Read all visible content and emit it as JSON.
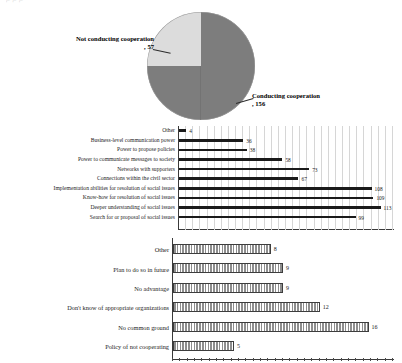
{
  "header": {
    "cut_off_text": "⌐ ⌐                         ⌐"
  },
  "pie": {
    "labels": {
      "not_conducting": "Not conducting\ncooperation, 57",
      "conducting": "Conducting\ncooperation, 156"
    }
  },
  "chart_data": [
    {
      "type": "pie",
      "title": "",
      "categories": [
        "Conducting cooperation",
        "Not conducting cooperation"
      ],
      "values": [
        156,
        57
      ],
      "labels": [
        "Conducting cooperation, 156",
        "Not conducting cooperation, 57"
      ],
      "colors": [
        "#7d7d7d",
        "#dcdcdc"
      ],
      "legend": "none",
      "grid": false
    },
    {
      "type": "bar",
      "orientation": "horizontal",
      "title": "",
      "xlabel": "",
      "ylabel": "",
      "grid": true,
      "xlim": [
        0,
        120
      ],
      "categories": [
        "Other",
        "Business-level communication power",
        "Power to propose policies",
        "Power to communicate messages to society",
        "Networks with supporters",
        "Connections within the civil sector",
        "Implementation abilities for resolution of social issues",
        "Know-how for resolution of social issues",
        "Deeper understanding of social issues",
        "Search for or proposal of social issues"
      ],
      "values": [
        4,
        36,
        38,
        58,
        73,
        67,
        108,
        109,
        113,
        99
      ]
    },
    {
      "type": "bar",
      "orientation": "horizontal",
      "title": "",
      "xlabel": "",
      "ylabel": "",
      "grid": false,
      "xlim": [
        0,
        18
      ],
      "categories": [
        "Other",
        "Plan to do so in future",
        "No advantage",
        "Don't know of appropriate organizations",
        "No common ground",
        "Policy of not cooperating"
      ],
      "values": [
        8,
        9,
        9,
        12,
        16,
        5
      ]
    }
  ]
}
